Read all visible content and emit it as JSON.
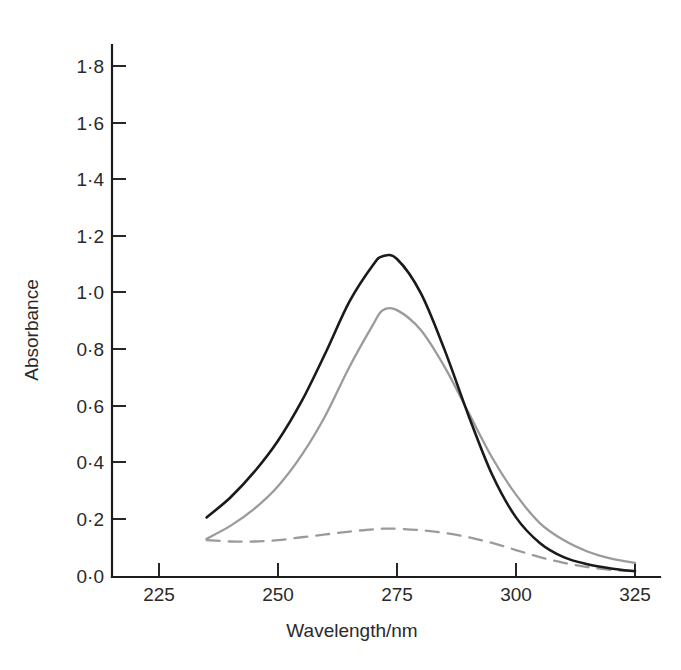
{
  "chart_data": {
    "type": "line",
    "title": "",
    "xlabel": "Wavelength/nm",
    "ylabel": "Absorbance",
    "xlim": [
      215,
      330
    ],
    "ylim": [
      0.0,
      1.9
    ],
    "grid": false,
    "legend": "none",
    "x_ticks": [
      225,
      250,
      275,
      300,
      325
    ],
    "x_tick_labels": [
      "225",
      "250",
      "275",
      "300",
      "325"
    ],
    "y_ticks": [
      0.0,
      0.2,
      0.4,
      0.6,
      0.8,
      1.0,
      1.2,
      1.4,
      1.6,
      1.8
    ],
    "y_tick_labels": [
      "0·0",
      "0·2",
      "0·4",
      "0·6",
      "0·8",
      "1·0",
      "1·2",
      "1·4",
      "1·6",
      "1·8"
    ],
    "x": [
      235,
      240,
      245,
      250,
      255,
      260,
      265,
      270,
      272,
      275,
      280,
      285,
      290,
      295,
      300,
      305,
      310,
      315,
      320,
      325
    ],
    "series": [
      {
        "name": "solid-dark-spectrum",
        "style": "solid",
        "color": "#1a1a1a",
        "values": [
          0.21,
          0.28,
          0.37,
          0.48,
          0.62,
          0.79,
          0.97,
          1.1,
          1.13,
          1.12,
          1.0,
          0.8,
          0.57,
          0.36,
          0.21,
          0.12,
          0.07,
          0.045,
          0.03,
          0.02
        ]
      },
      {
        "name": "solid-gray-spectrum",
        "style": "solid",
        "color": "#9b9b9b",
        "values": [
          0.135,
          0.18,
          0.24,
          0.32,
          0.43,
          0.57,
          0.74,
          0.89,
          0.94,
          0.94,
          0.87,
          0.74,
          0.58,
          0.42,
          0.29,
          0.19,
          0.13,
          0.09,
          0.065,
          0.05
        ]
      },
      {
        "name": "dashed-gray-spectrum",
        "style": "dashed",
        "color": "#9b9b9b",
        "values": [
          0.13,
          0.125,
          0.125,
          0.13,
          0.14,
          0.15,
          0.16,
          0.168,
          0.17,
          0.17,
          0.165,
          0.155,
          0.14,
          0.12,
          0.095,
          0.07,
          0.05,
          0.035,
          0.025,
          0.02
        ]
      }
    ]
  }
}
